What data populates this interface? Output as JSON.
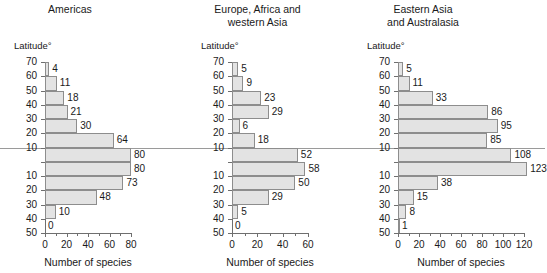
{
  "figure": {
    "equator_label": "equator-line",
    "axis_caption": "Number of species",
    "latitude_axis_title": "Latitude°"
  },
  "chart_data": [
    {
      "type": "bar",
      "orientation": "horizontal",
      "title": "Americas",
      "xlabel": "Number of species",
      "ylabel": "Latitude°",
      "xlim": [
        0,
        80
      ],
      "xticks": [
        0,
        20,
        40,
        60,
        80
      ],
      "xtick_labels": [
        "0",
        "20",
        "40",
        "60",
        "80"
      ],
      "xminor_step": 10,
      "grid": false,
      "yticks": [
        70,
        60,
        50,
        40,
        30,
        20,
        10,
        0,
        10,
        20,
        30,
        40,
        50
      ],
      "ytick_labels": [
        "70",
        "60",
        "50",
        "40",
        "30",
        "20",
        "10",
        "",
        "10",
        "20",
        "30",
        "40",
        "50"
      ],
      "categories": [
        "60-70N",
        "50-60N",
        "40-50N",
        "30-40N",
        "20-30N",
        "10-20N",
        "0-10N",
        "0-10S",
        "10-20S",
        "20-30S",
        "30-40S",
        "40-50S"
      ],
      "values": [
        4,
        11,
        18,
        21,
        30,
        64,
        80,
        80,
        73,
        48,
        10,
        0
      ],
      "value_labels": [
        "4",
        "11",
        "18",
        "21",
        "30",
        "64",
        "80",
        "80",
        "73",
        "48",
        "10",
        "0"
      ]
    },
    {
      "type": "bar",
      "orientation": "horizontal",
      "title": "Europe, Africa and\nwestern Asia",
      "xlabel": "Number of species",
      "ylabel": "Latitude°",
      "xlim": [
        0,
        60
      ],
      "xticks": [
        0,
        20,
        40,
        60
      ],
      "xtick_labels": [
        "0",
        "20",
        "40",
        "60"
      ],
      "xminor_step": 10,
      "grid": false,
      "yticks": [
        70,
        60,
        50,
        40,
        30,
        20,
        10,
        0,
        10,
        20,
        30,
        40,
        50
      ],
      "ytick_labels": [
        "70",
        "60",
        "50",
        "40",
        "30",
        "20",
        "10",
        "",
        "10",
        "20",
        "30",
        "40",
        "50"
      ],
      "categories": [
        "60-70N",
        "50-60N",
        "40-50N",
        "30-40N",
        "20-30N",
        "10-20N",
        "0-10N",
        "0-10S",
        "10-20S",
        "20-30S",
        "30-40S",
        "40-50S"
      ],
      "values": [
        5,
        9,
        23,
        29,
        6,
        18,
        52,
        58,
        50,
        29,
        5,
        0
      ],
      "value_labels": [
        "5",
        "9",
        "23",
        "29",
        "6",
        "18",
        "52",
        "58",
        "50",
        "29",
        "5",
        "0"
      ]
    },
    {
      "type": "bar",
      "orientation": "horizontal",
      "title": "Eastern Asia\nand Australasia",
      "xlabel": "Number of species",
      "ylabel": "Latitude°",
      "xlim": [
        0,
        120
      ],
      "xticks": [
        0,
        20,
        40,
        60,
        80,
        100,
        120
      ],
      "xtick_labels": [
        "0",
        "20",
        "40",
        "60",
        "80",
        "100",
        "120"
      ],
      "xminor_step": 10,
      "grid": false,
      "yticks": [
        70,
        60,
        50,
        40,
        30,
        20,
        10,
        0,
        10,
        20,
        30,
        40,
        50
      ],
      "ytick_labels": [
        "70",
        "60",
        "50",
        "40",
        "30",
        "20",
        "10",
        "",
        "10",
        "20",
        "30",
        "40",
        "50"
      ],
      "categories": [
        "60-70N",
        "50-60N",
        "40-50N",
        "30-40N",
        "20-30N",
        "10-20N",
        "0-10N",
        "0-10S",
        "10-20S",
        "20-30S",
        "30-40S",
        "40-50S"
      ],
      "values": [
        5,
        11,
        33,
        86,
        95,
        85,
        108,
        123,
        38,
        15,
        8,
        1
      ],
      "value_labels": [
        "5",
        "11",
        "33",
        "86",
        "95",
        "85",
        "108",
        "123",
        "38",
        "15",
        "8",
        "1"
      ]
    }
  ]
}
